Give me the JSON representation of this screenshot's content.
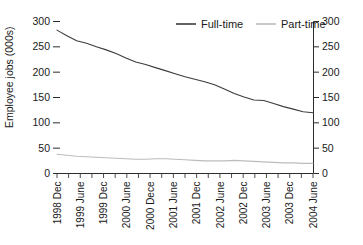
{
  "chart_data": {
    "type": "line",
    "title": "",
    "xlabel": "",
    "ylabel": "Employee jobs (000s)",
    "ylim": [
      0,
      300
    ],
    "ylim_right": [
      0,
      300
    ],
    "ytick_values": [
      0,
      50,
      100,
      150,
      200,
      250,
      300
    ],
    "ytick_labels": [
      "0",
      "50",
      "100",
      "150",
      "200",
      "250",
      "300"
    ],
    "ytick_labels_right": [
      "0",
      "50",
      "100",
      "150",
      "200",
      "250",
      "300"
    ],
    "grid": false,
    "legend_position": "top-center",
    "legend_entries": [
      "Full-time",
      "Part-time"
    ],
    "x_tick_labels": [
      "1998 Dec",
      "1999 June",
      "1999 Dec",
      "2000 June",
      "2000 Dece",
      "2001 June",
      "2001 Dec",
      "2002 June",
      "2002 Dec",
      "2003 June",
      "2003 Dec",
      "2004 June"
    ],
    "x_quarters": [
      "1998 Dec",
      "1999 Mar",
      "1999 June",
      "1999 Sep",
      "1999 Dec",
      "2000 Mar",
      "2000 June",
      "2000 Sep",
      "2000 Dece",
      "2001 Mar",
      "2001 June",
      "2001 Sep",
      "2001 Dec",
      "2002 Mar",
      "2002 June",
      "2002 Sep",
      "2002 Dec",
      "2003 Mar",
      "2003 June",
      "2003 Sep",
      "2003 Dec",
      "2004 Mar",
      "2004 June"
    ],
    "series": [
      {
        "name": "Full-time",
        "color": "#3c3c3c",
        "values": [
          283,
          272,
          262,
          257,
          250,
          244,
          237,
          228,
          220,
          215,
          209,
          203,
          197,
          191,
          186,
          181,
          175,
          167,
          158,
          151,
          145,
          144,
          138,
          132,
          127,
          122,
          120
        ]
      },
      {
        "name": "Part-time",
        "color": "#bcbcbc",
        "values": [
          38,
          36,
          34,
          33,
          32,
          31,
          30,
          29,
          28,
          28,
          29,
          29,
          28,
          27,
          26,
          25,
          25,
          25,
          26,
          25,
          24,
          23,
          22,
          21,
          21,
          20,
          20
        ]
      }
    ],
    "colors": {
      "full_time": "#3c3c3c",
      "part_time": "#bcbcbc",
      "axis": "#2b2b2b",
      "text": "#1a1a1a",
      "background": "#ffffff"
    }
  }
}
